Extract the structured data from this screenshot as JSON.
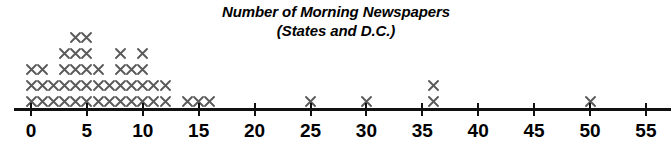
{
  "title": {
    "line1": "Number of Morning Newspapers",
    "line2": "(States and D.C.)"
  },
  "colors": {
    "mark": "#5a5a5a",
    "axis": "#111111",
    "text": "#000000",
    "background": "#ffffff"
  },
  "chart_data": {
    "type": "scatter",
    "plot_kind": "dotplot",
    "title": "Number of Morning Newspapers (States and D.C.)",
    "xlabel": "",
    "ylabel": "",
    "xlim": [
      0,
      55
    ],
    "x_tick_step": 5,
    "xticks": [
      0,
      5,
      10,
      15,
      20,
      25,
      30,
      35,
      40,
      45,
      50,
      55
    ],
    "xtick_labels": [
      "0",
      "5",
      "10",
      "15",
      "20",
      "25",
      "30",
      "35",
      "40",
      "45",
      "50",
      "55"
    ],
    "grid": false,
    "legend": null,
    "marker": "x",
    "total_count": 51,
    "categories": [
      0,
      1,
      2,
      3,
      4,
      5,
      6,
      7,
      8,
      9,
      10,
      11,
      12,
      14,
      15,
      16,
      25,
      30,
      36,
      50
    ],
    "values": [
      3,
      3,
      2,
      4,
      5,
      5,
      3,
      2,
      4,
      3,
      4,
      2,
      2,
      1,
      1,
      1,
      1,
      1,
      2,
      1
    ],
    "points": [
      {
        "x": 0,
        "count": 3
      },
      {
        "x": 1,
        "count": 3
      },
      {
        "x": 2,
        "count": 2
      },
      {
        "x": 3,
        "count": 4
      },
      {
        "x": 4,
        "count": 5
      },
      {
        "x": 5,
        "count": 5
      },
      {
        "x": 6,
        "count": 3
      },
      {
        "x": 7,
        "count": 2
      },
      {
        "x": 8,
        "count": 4
      },
      {
        "x": 9,
        "count": 3
      },
      {
        "x": 10,
        "count": 4
      },
      {
        "x": 11,
        "count": 2
      },
      {
        "x": 12,
        "count": 2
      },
      {
        "x": 14,
        "count": 1
      },
      {
        "x": 15,
        "count": 1
      },
      {
        "x": 16,
        "count": 1
      },
      {
        "x": 25,
        "count": 1
      },
      {
        "x": 30,
        "count": 1
      },
      {
        "x": 36,
        "count": 2
      },
      {
        "x": 50,
        "count": 1
      }
    ]
  },
  "axis_geometry": {
    "origin_px": 31,
    "px_per_unit": 11.18,
    "baseline_y_px": 101,
    "row_height_px": 16
  }
}
